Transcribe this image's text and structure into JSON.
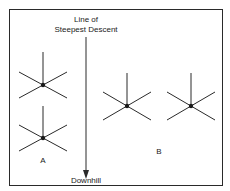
{
  "diagram": {
    "title_line1": "Line of",
    "title_line2": "Steepest Descent",
    "arrow_label": "Downhill",
    "group_a_label": "A",
    "group_b_label": "B",
    "colors": {
      "stroke": "#2a2a2a",
      "background": "#ffffff"
    },
    "stars": [
      {
        "group": "A",
        "cx": 43,
        "cy": 85
      },
      {
        "group": "A",
        "cx": 43,
        "cy": 138
      },
      {
        "group": "B",
        "cx": 127,
        "cy": 106
      },
      {
        "group": "B",
        "cx": 191,
        "cy": 106
      }
    ]
  }
}
